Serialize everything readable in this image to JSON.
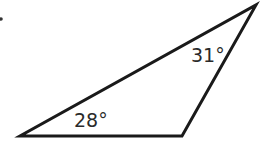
{
  "diagram": {
    "type": "triangle",
    "vertices": [
      [
        20,
        136
      ],
      [
        182,
        136
      ],
      [
        256,
        5
      ]
    ],
    "stroke_color": "#1a1a1a",
    "angles": [
      {
        "vertex": "left",
        "label": "28°"
      },
      {
        "vertex": "top",
        "label": "31°"
      }
    ]
  }
}
